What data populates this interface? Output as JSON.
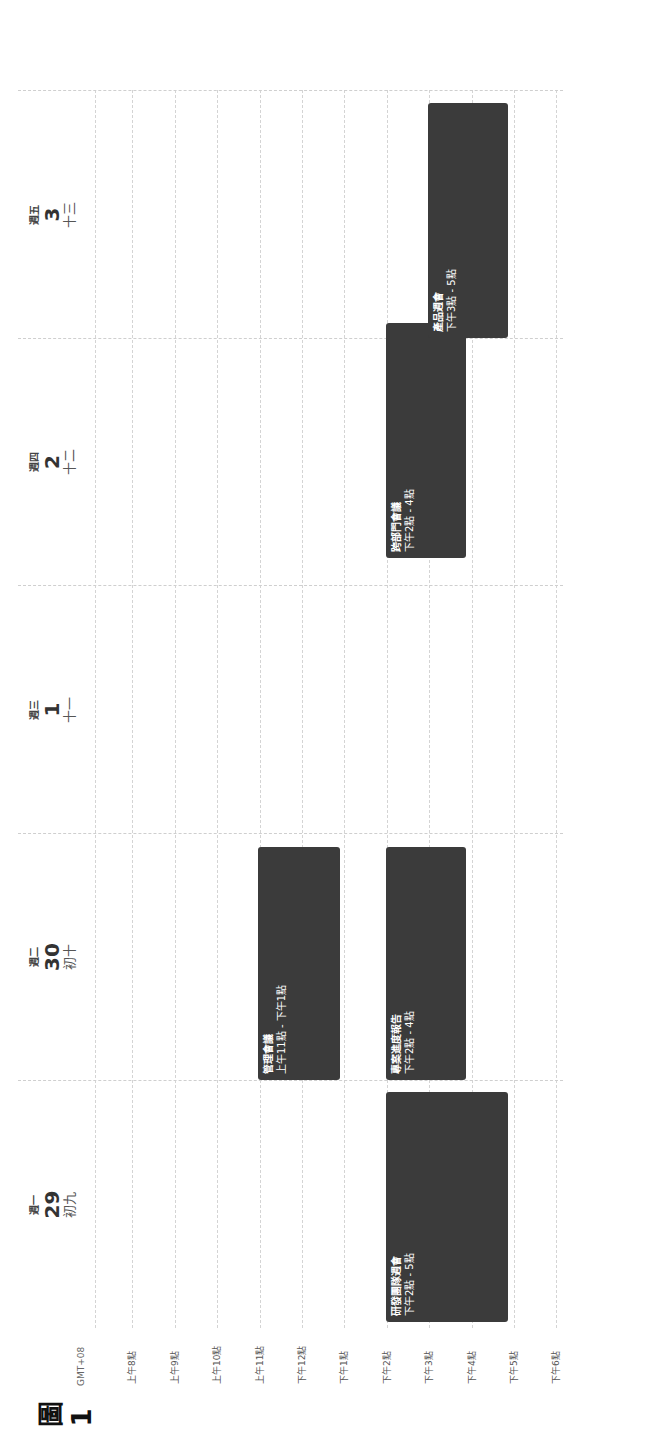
{
  "calendar": {
    "timezone": "GMT+08",
    "hours": [
      "上午8點",
      "上午9點",
      "上午10點",
      "上午11點",
      "下午12點",
      "下午1點",
      "下午2點",
      "下午3點",
      "下午4點",
      "下午5點",
      "下午6點"
    ],
    "days": [
      {
        "dow": "週一",
        "date": "29",
        "lunar": "初九"
      },
      {
        "dow": "週二",
        "date": "30",
        "lunar": "初十"
      },
      {
        "dow": "週三",
        "date": "1",
        "lunar": "十一"
      },
      {
        "dow": "週四",
        "date": "2",
        "lunar": "十二"
      },
      {
        "dow": "週五",
        "date": "3",
        "lunar": "十三"
      }
    ],
    "events": [
      {
        "day": 0,
        "title": "研發團隊週會",
        "time": "下午2點 - 5點",
        "start": 14,
        "end": 17
      },
      {
        "day": 1,
        "title": "管理會議",
        "time": "上午11點 - 下午1點",
        "start": 11,
        "end": 13
      },
      {
        "day": 1,
        "title": "專案進度報告",
        "time": "下午2點 - 4點",
        "start": 14,
        "end": 16
      },
      {
        "day": 3,
        "title": "跨部門會議",
        "time": "下午2點 - 4點",
        "start": 14,
        "end": 16
      },
      {
        "day": 4,
        "title": "產品週會",
        "time": "下午3點 - 5點",
        "start": 15,
        "end": 17
      }
    ],
    "event_color": "#3b3b3b"
  },
  "figure_label": "圖1"
}
